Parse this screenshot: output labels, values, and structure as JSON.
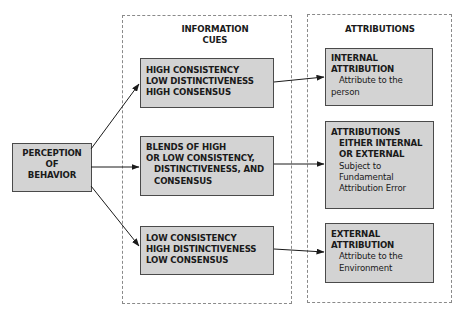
{
  "diagram": {
    "source_node": {
      "lines": [
        "PERCEPTION",
        "OF",
        "BEHAVIOR"
      ]
    },
    "columns": {
      "information_cues": {
        "title_lines": [
          "INFORMATION",
          "CUES"
        ]
      },
      "attributions": {
        "title": "ATTRIBUTIONS"
      }
    },
    "cue_boxes": [
      {
        "lines": [
          "HIGH CONSISTENCY",
          "LOW DISTINCTIVENESS",
          "HIGH CONSENSUS"
        ]
      },
      {
        "lines": [
          "BLENDS OF HIGH",
          "OR LOW CONSISTENCY,",
          "DISTINCTIVENESS, AND",
          "CONSENSUS"
        ]
      },
      {
        "lines": [
          "LOW CONSISTENCY",
          "HIGH DISTINCTIVENESS",
          "LOW CONSENSUS"
        ]
      }
    ],
    "attribution_boxes": [
      {
        "heading": [
          "INTERNAL",
          "ATTRIBUTION"
        ],
        "description": [
          "Attribute to the",
          "person"
        ]
      },
      {
        "heading": [
          "ATTRIBUTIONS",
          "EITHER INTERNAL",
          "OR EXTERNAL"
        ],
        "description": [
          "Subject to",
          "Fundamental",
          "Attribution Error"
        ]
      },
      {
        "heading": [
          "EXTERNAL",
          "ATTRIBUTION"
        ],
        "description": [
          "Attribute to the",
          "Environment"
        ]
      }
    ],
    "colors": {
      "box_fill": "#d3d3d3",
      "box_border": "#4a4a4a",
      "dashed_border": "#8a8a8a",
      "arrow": "#1a1a1a"
    }
  }
}
